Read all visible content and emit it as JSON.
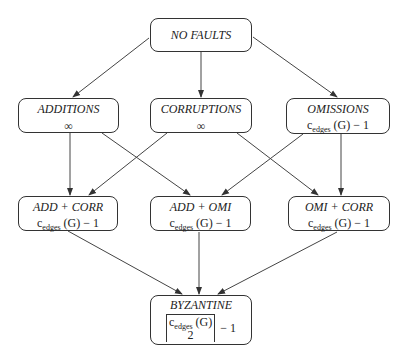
{
  "diagram": {
    "nodes": [
      {
        "id": "no_faults",
        "title": "NO FAULTS",
        "value": ""
      },
      {
        "id": "additions",
        "title": "ADDITIONS",
        "value": "∞"
      },
      {
        "id": "corruptions",
        "title": "CORRUPTIONS",
        "value": "∞"
      },
      {
        "id": "omissions",
        "title": "OMISSIONS",
        "value": {
          "base": "c",
          "sub": "edges",
          "rest": " (G) − 1"
        }
      },
      {
        "id": "add_corr",
        "title": "ADD + CORR",
        "value": {
          "base": "c",
          "sub": "edges",
          "rest": " (G) − 1"
        }
      },
      {
        "id": "add_omi",
        "title": "ADD + OMI",
        "value": {
          "base": "c",
          "sub": "edges",
          "rest": " (G) − 1"
        }
      },
      {
        "id": "omi_corr",
        "title": "OMI + CORR",
        "value": {
          "base": "c",
          "sub": "edges",
          "rest": " (G) − 1"
        }
      },
      {
        "id": "byzantine",
        "title": "BYZANTINE",
        "value": {
          "num_base": "c",
          "num_sub": "edges",
          "num_rest": " (G)",
          "den": "2",
          "suffix": "− 1"
        }
      }
    ],
    "edges": [
      [
        "no_faults",
        "additions"
      ],
      [
        "no_faults",
        "corruptions"
      ],
      [
        "no_faults",
        "omissions"
      ],
      [
        "additions",
        "add_corr"
      ],
      [
        "additions",
        "add_omi"
      ],
      [
        "corruptions",
        "add_corr"
      ],
      [
        "corruptions",
        "omi_corr"
      ],
      [
        "omissions",
        "add_omi"
      ],
      [
        "omissions",
        "omi_corr"
      ],
      [
        "add_corr",
        "byzantine"
      ],
      [
        "add_omi",
        "byzantine"
      ],
      [
        "omi_corr",
        "byzantine"
      ]
    ],
    "colors": {
      "stroke": "#333333",
      "background": "#ffffff"
    }
  }
}
